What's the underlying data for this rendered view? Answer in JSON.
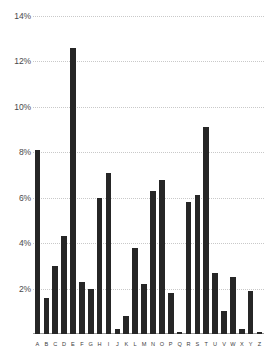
{
  "chart_data": {
    "type": "bar",
    "title": "",
    "subtitle": "",
    "xlabel": "",
    "ylabel": "",
    "categories": [
      "A",
      "B",
      "C",
      "D",
      "E",
      "F",
      "G",
      "H",
      "I",
      "J",
      "K",
      "L",
      "M",
      "N",
      "O",
      "P",
      "Q",
      "R",
      "S",
      "T",
      "U",
      "V",
      "W",
      "X",
      "Y",
      "Z"
    ],
    "values": [
      8.1,
      1.6,
      3.0,
      4.3,
      12.6,
      2.3,
      2.0,
      6.0,
      7.1,
      0.2,
      0.8,
      3.8,
      2.2,
      6.3,
      6.8,
      1.8,
      0.1,
      5.8,
      6.1,
      9.1,
      2.7,
      1.0,
      2.5,
      0.2,
      1.9,
      0.07
    ],
    "value_suffix": "%",
    "ylim": [
      0,
      14
    ],
    "y_ticks": [
      2,
      4,
      6,
      8,
      10,
      12,
      14
    ],
    "y_tick_labels": [
      "2%",
      "4%",
      "6%",
      "8%",
      "10%",
      "12%",
      "14%"
    ],
    "grid": true,
    "grid_axis": "y",
    "legend": null,
    "legend_position": "none",
    "bar_color": "#262626",
    "grid_color": "#c9c9c9",
    "axis_color": "#9a9a9a",
    "tick_label_color": "#4a4a4a",
    "background_color": "#ffffff"
  }
}
